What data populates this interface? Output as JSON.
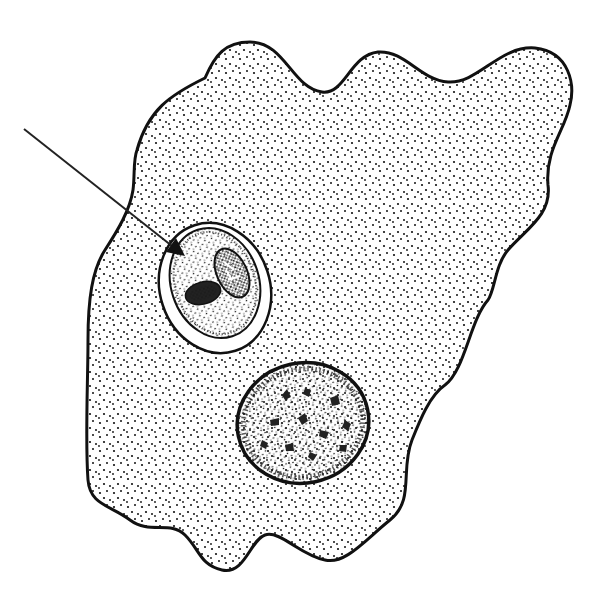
{
  "figure": {
    "background": "#ffffff",
    "ink": "#111111",
    "parts": [
      {
        "name": "cell-membrane",
        "label": "cell outline"
      },
      {
        "name": "phagocytic-vacuole",
        "label": "vacuole with engulfed cell"
      },
      {
        "name": "engulfed-cell",
        "label": "ingested cell"
      },
      {
        "name": "nucleus",
        "label": "nucleus"
      },
      {
        "name": "pointer-arrow",
        "label": "arrow pointing to engulfed cell"
      }
    ]
  }
}
